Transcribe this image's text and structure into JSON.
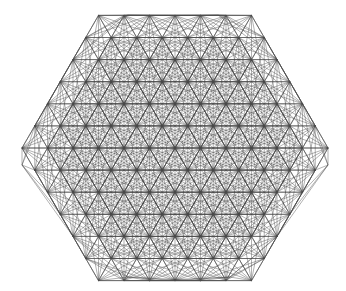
{
  "figure": {
    "canvas": {
      "width": 346,
      "height": 291,
      "background_color": "#ffffff"
    },
    "stroke": {
      "color": "#4a4a4a",
      "width": 0.45,
      "opacity": 0.95
    },
    "geometry": {
      "lattice_type": "triangular",
      "lattice_rings": 6,
      "lattice_spacing_x": 25.5,
      "lattice_spacing_y": 22.1,
      "center_x": 175,
      "center_y": 148,
      "connection_rule": "segments between lattice point pairs whose separation is at most 3 lattice units",
      "max_connection_distance_units": 3.05
    },
    "silhouette": {
      "shape": "six-pointed star",
      "point_count": 6,
      "tips": [
        {
          "name": "top-left-tip",
          "x": 128,
          "y": 15
        },
        {
          "name": "top-right-tip",
          "x": 218,
          "y": 15
        },
        {
          "name": "right-tip",
          "x": 328,
          "y": 165
        },
        {
          "name": "bottom-right-tip",
          "x": 230,
          "y": 277
        },
        {
          "name": "bottom-left-tip",
          "x": 128,
          "y": 277
        },
        {
          "name": "left-tip",
          "x": 22,
          "y": 165
        }
      ],
      "horizontal_extent": [
        22,
        328
      ],
      "vertical_extent": [
        15,
        277
      ]
    },
    "voids": {
      "shape": "hexagonal",
      "description": "regular array of small white hexagonal gaps in the dense web",
      "count": 12
    }
  }
}
